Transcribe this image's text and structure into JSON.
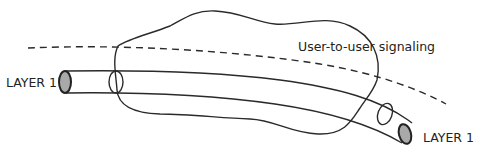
{
  "diagram": {
    "labels": {
      "layer_left": "LAYER 1",
      "layer_right": "LAYER 1",
      "signaling": "User-to-user signaling"
    },
    "colors": {
      "stroke": "#2a2a2a",
      "end_cap_fill": "#a9a9a9",
      "background": "#ffffff"
    }
  }
}
